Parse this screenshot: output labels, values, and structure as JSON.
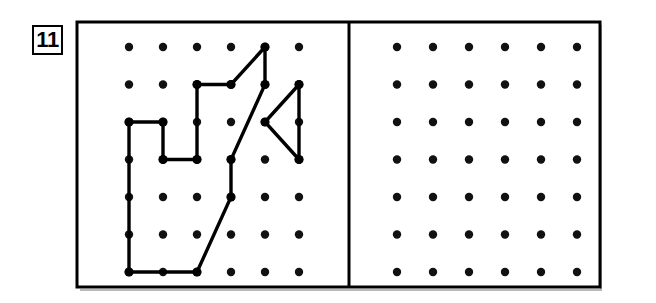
{
  "page": {
    "problem_number": "11",
    "background_color": "#ffffff",
    "ink_color": "#000000"
  },
  "frame": {
    "x": 77,
    "y": 22,
    "width": 523,
    "height": 265,
    "stroke_width": 3,
    "divider_x": 349
  },
  "grid": {
    "columns": 6,
    "rows": 7,
    "dot_radius": 4.2,
    "dot_color": "#111111",
    "left_panel": {
      "origin_x": 129,
      "origin_y": 47,
      "step_x": 34,
      "step_y": 37.5
    },
    "right_panel": {
      "origin_x": 397,
      "origin_y": 47,
      "step_x": 36,
      "step_y": 37.5
    }
  },
  "chart_data": {
    "type": "scatter",
    "xlabel": "",
    "ylabel": "",
    "panels": [
      {
        "name": "left-panel-with-shape",
        "columns": 6,
        "rows": 7,
        "has_shape": true
      },
      {
        "name": "right-panel-blank",
        "columns": 6,
        "rows": 7,
        "has_shape": false
      }
    ]
  },
  "shape": {
    "name": "geoboard-polygon",
    "stroke_width": 3.4,
    "vertex_dot_radius": 4.6,
    "paths": [
      {
        "name": "main-outline",
        "closed": true,
        "points_grid": [
          [
            0,
            2
          ],
          [
            1,
            2
          ],
          [
            1,
            3
          ],
          [
            2,
            3
          ],
          [
            2,
            1
          ],
          [
            3,
            1
          ],
          [
            4,
            0
          ],
          [
            4,
            1
          ],
          [
            3,
            3
          ],
          [
            3,
            4
          ],
          [
            2,
            6
          ],
          [
            0,
            6
          ]
        ]
      },
      {
        "name": "triangle",
        "closed": true,
        "points_grid": [
          [
            4,
            2
          ],
          [
            5,
            1
          ],
          [
            5,
            3
          ]
        ]
      }
    ]
  }
}
